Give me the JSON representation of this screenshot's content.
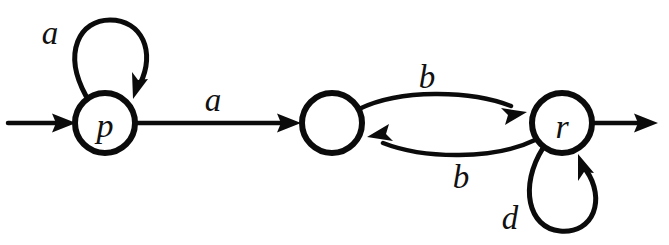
{
  "figure": {
    "name": "finite-state-automaton",
    "width": 669,
    "height": 245,
    "background_color": "#ffffff",
    "stroke_color": "#0b0b0b",
    "text_color": "#111111"
  },
  "states": [
    {
      "id": "p",
      "label": "p",
      "cx": 105,
      "cy": 123,
      "r": 30,
      "has_label": true,
      "is_start": true,
      "is_accepting": false
    },
    {
      "id": "q",
      "label": "",
      "cx": 332,
      "cy": 123,
      "r": 30,
      "has_label": false,
      "is_start": false,
      "is_accepting": false
    },
    {
      "id": "r",
      "label": "r",
      "cx": 562,
      "cy": 123,
      "r": 30,
      "has_label": true,
      "is_start": false,
      "is_accepting": true
    }
  ],
  "transitions": [
    {
      "id": "start-arrow",
      "from": "",
      "to": "p",
      "label": "",
      "kind": "start-marker"
    },
    {
      "id": "p-self-loop",
      "from": "p",
      "to": "p",
      "label": "a",
      "kind": "self-loop",
      "label_x": 50,
      "label_y": 33
    },
    {
      "id": "p-to-q",
      "from": "p",
      "to": "q",
      "label": "a",
      "kind": "straight",
      "label_x": 213,
      "label_y": 100
    },
    {
      "id": "q-to-r",
      "from": "q",
      "to": "r",
      "label": "b",
      "kind": "curve-upper",
      "label_x": 427,
      "label_y": 77
    },
    {
      "id": "r-to-q",
      "from": "r",
      "to": "q",
      "label": "b",
      "kind": "curve-lower",
      "label_x": 461,
      "label_y": 177
    },
    {
      "id": "r-self-loop",
      "from": "r",
      "to": "r",
      "label": "d",
      "kind": "self-loop",
      "label_x": 510,
      "label_y": 218
    },
    {
      "id": "accept-arrow",
      "from": "r",
      "to": "",
      "label": "",
      "kind": "accept-marker"
    }
  ]
}
